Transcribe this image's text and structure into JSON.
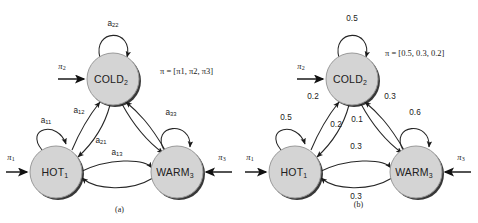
{
  "figure": {
    "background_color": "#ffffff",
    "node_fill": "#d4d4d4",
    "node_stroke": "#9a9a9a",
    "edge_color": "#262626"
  },
  "panel_a": {
    "caption": "(a)",
    "nodes": [
      {
        "id": "hot",
        "base": "HOT",
        "sub": "1",
        "cx": 56,
        "cy": 172,
        "r": 26
      },
      {
        "id": "cold",
        "base": "COLD",
        "sub": "2",
        "cx": 113,
        "cy": 79,
        "r": 26
      },
      {
        "id": "warm",
        "base": "WARM",
        "sub": "3",
        "cx": 177,
        "cy": 172,
        "r": 26
      }
    ],
    "self_loops": [
      {
        "id": "a11",
        "base": "a",
        "sub": "11",
        "lx": 46,
        "ly": 120
      },
      {
        "id": "a22",
        "base": "a",
        "sub": "22",
        "lx": 113,
        "ly": 23
      },
      {
        "id": "a33",
        "base": "a",
        "sub": "33",
        "lx": 171,
        "ly": 112
      }
    ],
    "edge_labels": [
      {
        "id": "a12",
        "base": "a",
        "sub": "12",
        "lx": 79,
        "ly": 110
      },
      {
        "id": "a21",
        "base": "a",
        "sub": "21",
        "lx": 101,
        "ly": 140
      },
      {
        "id": "a13",
        "base": "a",
        "sub": "13",
        "lx": 117,
        "ly": 152
      }
    ],
    "initial_arrows": [
      {
        "id": "pi1",
        "base": "π",
        "sub": "1",
        "lx": 11,
        "ly": 158
      },
      {
        "id": "pi2",
        "base": "π",
        "sub": "2",
        "lx": 62,
        "ly": 67
      },
      {
        "id": "pi3",
        "base": "π",
        "sub": "3",
        "lx": 222,
        "ly": 158
      }
    ],
    "pi_vector": {
      "prefix": "π",
      "equals": " = [",
      "items": [
        "π1",
        "π2",
        "π3"
      ],
      "suffix": "]",
      "display": "π = [π1, π2, π3]"
    }
  },
  "panel_b": {
    "caption": "(b)",
    "nodes": [
      {
        "id": "hot",
        "base": "HOT",
        "sub": "1",
        "cx": 56,
        "cy": 172,
        "r": 26
      },
      {
        "id": "cold",
        "base": "COLD",
        "sub": "2",
        "cx": 113,
        "cy": 79,
        "r": 26
      },
      {
        "id": "warm",
        "base": "WARM",
        "sub": "3",
        "cx": 177,
        "cy": 172,
        "r": 26
      }
    ],
    "self_loops": [
      {
        "id": "p11",
        "value": "0.5",
        "lx": 47,
        "ly": 117
      },
      {
        "id": "p22",
        "value": "0.5",
        "lx": 113,
        "ly": 18
      },
      {
        "id": "p33",
        "value": "0.6",
        "lx": 176,
        "ly": 112
      }
    ],
    "edge_labels": [
      {
        "id": "p12",
        "value": "0.2",
        "lx": 74,
        "ly": 96
      },
      {
        "id": "p32",
        "value": "0.3",
        "lx": 151,
        "ly": 96
      },
      {
        "id": "p21",
        "value": "0.2",
        "lx": 97,
        "ly": 124
      },
      {
        "id": "p23",
        "value": "0.1",
        "lx": 118,
        "ly": 119
      },
      {
        "id": "p13",
        "value": "0.3",
        "lx": 117,
        "ly": 146
      },
      {
        "id": "p31",
        "value": "0.3",
        "lx": 117,
        "ly": 196
      }
    ],
    "initial_arrows": [
      {
        "id": "pi1",
        "base": "π",
        "sub": "1",
        "lx": 11,
        "ly": 158
      },
      {
        "id": "pi2",
        "base": "π",
        "sub": "2",
        "lx": 62,
        "ly": 67
      },
      {
        "id": "pi3",
        "base": "π",
        "sub": "3",
        "lx": 222,
        "ly": 158
      }
    ],
    "pi_vector": {
      "prefix": "π",
      "equals": " = [",
      "items": [
        "0.5",
        "0.3",
        "0.2"
      ],
      "suffix": "]",
      "display": "π = [0.5, 0.3, 0.2]"
    }
  }
}
